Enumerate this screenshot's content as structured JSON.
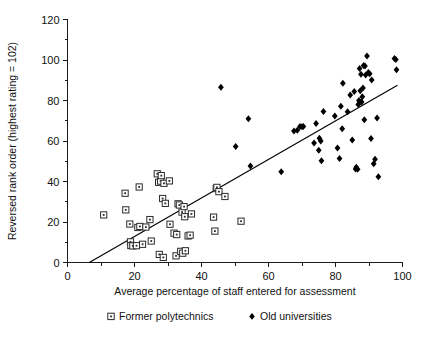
{
  "figure": {
    "background": "#ffffff",
    "ink_color": "#111111"
  },
  "chart_data": {
    "type": "scatter",
    "title": "",
    "xlabel": "Average percentage of staff entered for assessment",
    "ylabel": "Reversed rank order (highest rating = 102)",
    "xlim": [
      0,
      100
    ],
    "ylim": [
      0,
      120
    ],
    "xticks": [
      0,
      20,
      40,
      60,
      80,
      100
    ],
    "yticks": [
      0,
      20,
      40,
      60,
      80,
      100,
      120
    ],
    "xminor_step": 10,
    "yminor_step": 10,
    "grid": false,
    "legend_position": "below-axis",
    "series": [
      {
        "name": "Former polytechnics",
        "marker": "open-square-dot",
        "color": "#2b2b2b",
        "points": [
          [
            10.8,
            23.5
          ],
          [
            17.2,
            34.2
          ],
          [
            17.4,
            26.0
          ],
          [
            18.6,
            19.0
          ],
          [
            18.8,
            10.2
          ],
          [
            18.9,
            8.4
          ],
          [
            19.5,
            8.2
          ],
          [
            20.6,
            8.3
          ],
          [
            21.0,
            17.3
          ],
          [
            21.4,
            37.3
          ],
          [
            21.6,
            17.8
          ],
          [
            22.4,
            9.0
          ],
          [
            23.4,
            17.5
          ],
          [
            24.6,
            21.2
          ],
          [
            25.0,
            10.6
          ],
          [
            26.8,
            43.8
          ],
          [
            27.2,
            39.6
          ],
          [
            27.4,
            4.0
          ],
          [
            27.8,
            40.2
          ],
          [
            28.0,
            42.9
          ],
          [
            28.4,
            31.6
          ],
          [
            28.6,
            2.5
          ],
          [
            28.8,
            39.1
          ],
          [
            29.2,
            29.2
          ],
          [
            30.4,
            40.3
          ],
          [
            30.6,
            18.9
          ],
          [
            31.8,
            14.5
          ],
          [
            32.4,
            3.3
          ],
          [
            32.6,
            13.8
          ],
          [
            33.0,
            29.0
          ],
          [
            33.4,
            28.4
          ],
          [
            33.8,
            5.5
          ],
          [
            34.2,
            24.9
          ],
          [
            34.4,
            4.6
          ],
          [
            34.8,
            27.6
          ],
          [
            35.0,
            22.6
          ],
          [
            35.2,
            5.8
          ],
          [
            36.0,
            13.1
          ],
          [
            36.6,
            13.5
          ],
          [
            37.0,
            24.0
          ],
          [
            43.6,
            22.4
          ],
          [
            44.0,
            15.5
          ],
          [
            44.4,
            36.5
          ],
          [
            44.6,
            37.1
          ],
          [
            45.2,
            35.0
          ],
          [
            47.0,
            32.6
          ],
          [
            51.8,
            20.4
          ]
        ]
      },
      {
        "name": "Old universities",
        "marker": "filled-diamond",
        "color": "#000000",
        "points": [
          [
            45.8,
            86.5
          ],
          [
            50.2,
            57.3
          ],
          [
            54.0,
            71.0
          ],
          [
            54.6,
            47.7
          ],
          [
            63.8,
            44.8
          ],
          [
            67.6,
            65.0
          ],
          [
            68.6,
            65.3
          ],
          [
            69.4,
            67.2
          ],
          [
            70.0,
            67.0
          ],
          [
            70.4,
            67.2
          ],
          [
            73.6,
            59.0
          ],
          [
            74.2,
            68.6
          ],
          [
            75.0,
            55.4
          ],
          [
            75.2,
            61.4
          ],
          [
            75.6,
            60.0
          ],
          [
            75.8,
            50.2
          ],
          [
            76.4,
            74.6
          ],
          [
            79.8,
            72.3
          ],
          [
            80.6,
            56.6
          ],
          [
            81.2,
            51.3
          ],
          [
            81.6,
            77.2
          ],
          [
            82.0,
            66.0
          ],
          [
            82.2,
            88.5
          ],
          [
            83.6,
            74.5
          ],
          [
            84.4,
            82.7
          ],
          [
            85.0,
            60.5
          ],
          [
            85.6,
            84.4
          ],
          [
            86.0,
            46.2
          ],
          [
            86.2,
            47.0
          ],
          [
            86.6,
            46.0
          ],
          [
            86.8,
            78.0
          ],
          [
            87.0,
            80.0
          ],
          [
            87.2,
            95.8
          ],
          [
            87.4,
            84.8
          ],
          [
            87.6,
            93.0
          ],
          [
            87.8,
            79.3
          ],
          [
            88.0,
            81.8
          ],
          [
            88.2,
            86.2
          ],
          [
            88.4,
            97.3
          ],
          [
            88.6,
            70.5
          ],
          [
            88.8,
            97.0
          ],
          [
            89.0,
            92.6
          ],
          [
            89.4,
            102.0
          ],
          [
            89.8,
            93.8
          ],
          [
            90.2,
            93.2
          ],
          [
            90.6,
            61.2
          ],
          [
            90.8,
            90.1
          ],
          [
            91.4,
            48.8
          ],
          [
            91.8,
            51.0
          ],
          [
            92.4,
            71.4
          ],
          [
            92.8,
            42.4
          ],
          [
            97.6,
            100.8
          ],
          [
            98.0,
            100.2
          ],
          [
            98.2,
            95.2
          ]
        ]
      }
    ],
    "fit_line": {
      "name": "regression line",
      "x_start": 6.5,
      "y_start": 0,
      "x_end": 98.5,
      "y_end": 87.5
    }
  },
  "legend": {
    "entries": [
      {
        "label": "Former polytechnics",
        "marker": "open-square-dot"
      },
      {
        "label": "Old universities",
        "marker": "filled-diamond"
      }
    ]
  },
  "axes": {
    "x_tick_labels": [
      "0",
      "20",
      "40",
      "60",
      "80",
      "100"
    ],
    "y_tick_labels": [
      "0",
      "20",
      "40",
      "60",
      "80",
      "100",
      "120"
    ],
    "x_title": "Average percentage of staff entered for assessment",
    "y_title": "Reversed rank order (highest rating = 102)"
  }
}
